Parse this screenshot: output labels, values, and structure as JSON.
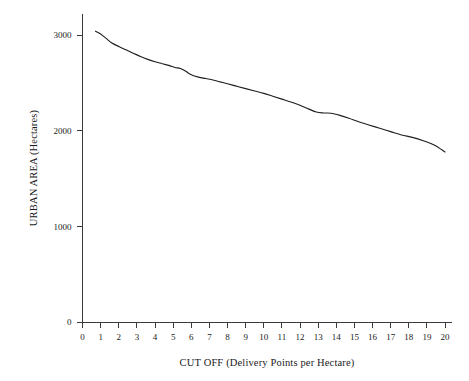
{
  "chart_data": {
    "type": "line",
    "title": "",
    "subtitle": "",
    "xlabel": "CUT OFF (Delivery Points per Hectare)",
    "ylabel": "URBAN AREA (Hectares)",
    "xlim": [
      0,
      20
    ],
    "ylim": [
      0,
      3200
    ],
    "xticks": [
      0,
      1,
      2,
      3,
      4,
      5,
      6,
      7,
      8,
      9,
      10,
      11,
      12,
      13,
      14,
      15,
      16,
      17,
      18,
      19,
      20
    ],
    "xtick_labels": [
      "0",
      "1",
      "2",
      "3",
      "4",
      "5",
      "6",
      "7",
      "8",
      "9",
      "10",
      "11",
      "12",
      "13",
      "14",
      "15",
      "16",
      "17",
      "18",
      "19",
      "20"
    ],
    "yticks": [
      0,
      1000,
      2000,
      3000
    ],
    "ytick_labels": [
      "0",
      "1000",
      "2000",
      "3000"
    ],
    "grid": false,
    "legend": false,
    "legend_position": "none",
    "line_color": "#1f1f1f",
    "series": [
      {
        "name": "Urban area vs cut off",
        "x": [
          0.72,
          1.0,
          1.3,
          1.6,
          2.0,
          2.4,
          2.8,
          3.2,
          3.6,
          4.0,
          4.4,
          4.8,
          5.1,
          5.4,
          5.7,
          6.0,
          6.4,
          6.8,
          7.2,
          7.6,
          8.0,
          8.5,
          9.0,
          9.5,
          10.0,
          10.5,
          11.0,
          11.5,
          12.0,
          12.5,
          12.9,
          13.3,
          13.7,
          14.2,
          14.7,
          15.2,
          15.8,
          16.4,
          17.0,
          17.6,
          18.2,
          18.8,
          19.4,
          20.0
        ],
        "y": [
          3040,
          3010,
          2965,
          2920,
          2880,
          2845,
          2810,
          2775,
          2745,
          2720,
          2700,
          2680,
          2660,
          2650,
          2620,
          2585,
          2560,
          2545,
          2530,
          2510,
          2490,
          2465,
          2440,
          2415,
          2390,
          2360,
          2330,
          2300,
          2265,
          2225,
          2195,
          2185,
          2182,
          2160,
          2130,
          2095,
          2060,
          2025,
          1990,
          1955,
          1930,
          1895,
          1850,
          1777
        ]
      }
    ]
  },
  "axis": {
    "x_label": "CUT OFF (Delivery Points per Hectare)",
    "y_label": "URBAN AREA (Hectares)"
  }
}
